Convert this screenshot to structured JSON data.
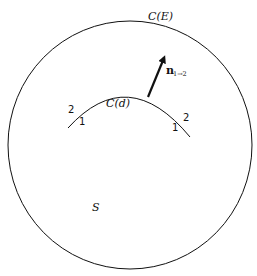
{
  "diagram": {
    "outer_curve_label": "C(E)",
    "inner_curve_label": "C(d)",
    "region_label": "S",
    "normal_vector": {
      "symbol": "n",
      "subscript": "1→2"
    },
    "side_labels": {
      "left_outer": "2",
      "left_inner": "1",
      "right_outer": "2",
      "right_inner": "1"
    },
    "colors": {
      "stroke": "#111111",
      "background": "#ffffff"
    }
  }
}
